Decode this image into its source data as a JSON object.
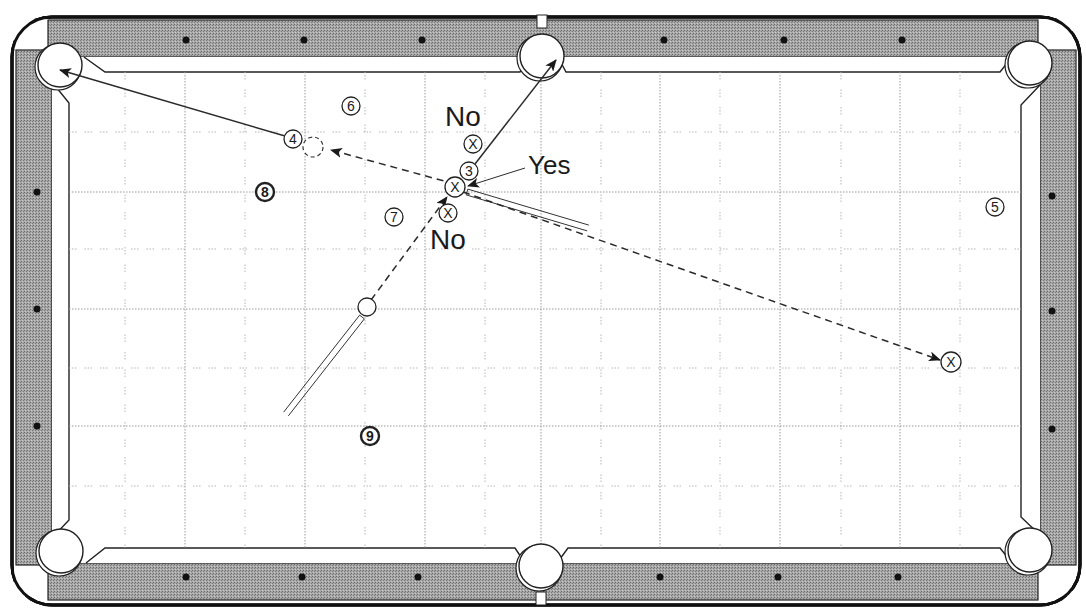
{
  "diagram": {
    "type": "pool-table-shot-diagram",
    "colors": {
      "rail": "#9a9a9a",
      "rail_border": "#111111",
      "cloth": "#ffffff",
      "line": "#2a2a2a",
      "grid": "#9a9a9a",
      "diamond": "#111111"
    },
    "table": {
      "outer": {
        "x": 12,
        "y": 17,
        "w": 1068,
        "h": 588
      },
      "play_area": {
        "x": 67,
        "y": 72,
        "w": 954,
        "h": 477
      },
      "pockets": [
        {
          "name": "top-left",
          "cx": 60,
          "cy": 65,
          "r": 22
        },
        {
          "name": "top-middle",
          "cx": 542,
          "cy": 56,
          "r": 22
        },
        {
          "name": "top-right",
          "cx": 1030,
          "cy": 63,
          "r": 22
        },
        {
          "name": "bottom-left",
          "cx": 61,
          "cy": 551,
          "r": 22
        },
        {
          "name": "bottom-middle",
          "cx": 541,
          "cy": 566,
          "r": 22
        },
        {
          "name": "bottom-right",
          "cx": 1030,
          "cy": 550,
          "r": 22
        }
      ],
      "diamonds": {
        "top": [
          186,
          304,
          422,
          664,
          784,
          902
        ],
        "bottom": [
          186,
          302,
          418,
          660,
          778,
          898
        ],
        "left": [
          192,
          309,
          426
        ],
        "right": [
          196,
          311,
          429
        ]
      }
    },
    "grid": {
      "dotted_x": [
        185,
        305,
        425,
        541,
        660,
        780,
        900
      ],
      "dashed_x": [
        125,
        245,
        365,
        485,
        601,
        720,
        841,
        960
      ],
      "dotted_y": [
        192,
        309,
        426
      ],
      "dashed_y": [
        132,
        249,
        368,
        486
      ]
    },
    "balls": [
      {
        "id": "ball-3",
        "label": "3",
        "cx": 469,
        "cy": 171,
        "r": 9,
        "style": "plain"
      },
      {
        "id": "ball-4",
        "label": "4",
        "cx": 293,
        "cy": 139,
        "r": 9,
        "style": "plain"
      },
      {
        "id": "ball-5",
        "label": "5",
        "cx": 995,
        "cy": 207,
        "r": 9,
        "style": "plain"
      },
      {
        "id": "ball-6",
        "label": "6",
        "cx": 351,
        "cy": 106,
        "r": 9,
        "style": "plain"
      },
      {
        "id": "ball-7",
        "label": "7",
        "cx": 394,
        "cy": 217,
        "r": 9,
        "style": "plain"
      },
      {
        "id": "ball-8",
        "label": "8",
        "cx": 265,
        "cy": 192,
        "r": 9,
        "style": "bold"
      },
      {
        "id": "ball-9",
        "label": "9",
        "cx": 370,
        "cy": 436,
        "r": 9,
        "style": "bold"
      },
      {
        "id": "cue-ball",
        "label": "",
        "cx": 367,
        "cy": 307,
        "r": 9,
        "style": "cue"
      }
    ],
    "ghost_ball": {
      "cx": 313,
      "cy": 147,
      "r": 10
    },
    "x_marks": [
      {
        "id": "x-no-upper",
        "label": "X",
        "cx": 473,
        "cy": 144,
        "r": 9
      },
      {
        "id": "x-contact",
        "label": "X",
        "cx": 455,
        "cy": 187,
        "r": 10
      },
      {
        "id": "x-no-lower",
        "label": "X",
        "cx": 448,
        "cy": 213,
        "r": 9
      },
      {
        "id": "x-target-right",
        "label": "X",
        "cx": 951,
        "cy": 362,
        "r": 10
      }
    ],
    "labels": [
      {
        "id": "label-no-top",
        "text": "No",
        "x": 445,
        "y": 103,
        "size": 28
      },
      {
        "id": "label-yes",
        "text": "Yes",
        "x": 528,
        "y": 152,
        "size": 26
      },
      {
        "id": "label-no-bottom",
        "text": "No",
        "x": 430,
        "y": 226,
        "size": 28
      }
    ],
    "paths": {
      "solid": [
        {
          "id": "ball4-to-corner-pocket",
          "x1": 285,
          "y1": 136,
          "x2": 60,
          "y2": 70,
          "arrow": true
        },
        {
          "id": "ball3-to-side-pocket",
          "x1": 475,
          "y1": 164,
          "x2": 556,
          "y2": 60,
          "arrow": true
        },
        {
          "id": "yes-pointer",
          "x1": 525,
          "y1": 168,
          "x2": 468,
          "y2": 186,
          "arrow": true
        }
      ],
      "dashed": [
        {
          "id": "contact-to-ghost",
          "x1": 455,
          "y1": 184,
          "x2": 331,
          "y2": 150,
          "arrow": true
        },
        {
          "id": "cue-to-contact",
          "x1": 371,
          "y1": 300,
          "x2": 447,
          "y2": 197,
          "arrow": true
        },
        {
          "id": "contact-to-right-x",
          "x1": 463,
          "y1": 192,
          "x2": 940,
          "y2": 360,
          "arrow": true
        }
      ]
    },
    "cue_sticks": [
      {
        "id": "cue-stick-lower",
        "x1": 362,
        "y1": 317,
        "x2": 286,
        "y2": 414,
        "width": 6
      },
      {
        "id": "cue-stick-upper",
        "x1": 467,
        "y1": 192,
        "x2": 588,
        "y2": 228,
        "width": 6
      }
    ]
  }
}
